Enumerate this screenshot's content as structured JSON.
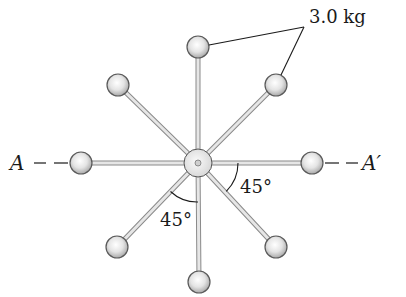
{
  "figure": {
    "type": "rotating rod assembly with point masses",
    "hub": {
      "cx": 198,
      "cy": 163,
      "r": 14
    },
    "rods": [
      {
        "id": "top",
        "angle_deg": 90,
        "ball": {
          "cx": 198,
          "cy": 47
        }
      },
      {
        "id": "upper-right",
        "angle_deg": 45,
        "ball": {
          "cx": 276,
          "cy": 85
        }
      },
      {
        "id": "right",
        "angle_deg": 0,
        "ball": {
          "cx": 312,
          "cy": 163
        }
      },
      {
        "id": "lower-right",
        "angle_deg": -45,
        "ball": {
          "cx": 276,
          "cy": 247
        }
      },
      {
        "id": "bottom",
        "angle_deg": -90,
        "ball": {
          "cx": 199,
          "cy": 282
        }
      },
      {
        "id": "lower-left",
        "angle_deg": -135,
        "ball": {
          "cx": 117,
          "cy": 247
        }
      },
      {
        "id": "left",
        "angle_deg": 180,
        "ball": {
          "cx": 81,
          "cy": 163
        }
      },
      {
        "id": "upper-left",
        "angle_deg": 135,
        "ball": {
          "cx": 118,
          "cy": 85
        }
      }
    ],
    "ball_radius": 11
  },
  "labels": {
    "mass": "3.0 kg",
    "axis_left": "A",
    "axis_right": "A′",
    "angle_right": "45°",
    "angle_left": "45°"
  },
  "colors": {
    "ink": "#1a1a1a",
    "rod": "#d8d8d8",
    "rod_edge": "#8a8a8a",
    "ball_light": "#ffffff",
    "ball_dark": "#b8b8b8"
  }
}
